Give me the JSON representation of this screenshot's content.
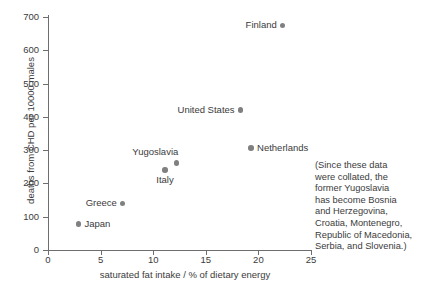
{
  "chart_data": {
    "type": "scatter",
    "title": "",
    "xlabel": "saturated fat intake / % of dietary energy",
    "ylabel": "deaths from CHD per 10000 males",
    "xlim": [
      0,
      25
    ],
    "ylim": [
      0,
      700
    ],
    "xticks": [
      0,
      5,
      10,
      15,
      20,
      25
    ],
    "yticks": [
      0,
      100,
      200,
      300,
      400,
      500,
      600,
      700
    ],
    "grid": false,
    "legend": "none",
    "point_color": "#808080",
    "axis_color": "#6e6e6e",
    "text_color": "#3b3b3b",
    "points": [
      {
        "label": "Japan",
        "x": 2.9,
        "y": 78,
        "label_position": "right"
      },
      {
        "label": "Greece",
        "x": 7.1,
        "y": 140,
        "label_position": "left"
      },
      {
        "label": "Italy",
        "x": 11.1,
        "y": 240,
        "label_position": "below"
      },
      {
        "label": "Yugoslavia",
        "x": 12.2,
        "y": 262,
        "label_position": "above-left"
      },
      {
        "label": "United States",
        "x": 18.3,
        "y": 420,
        "label_position": "left"
      },
      {
        "label": "Netherlands",
        "x": 19.3,
        "y": 307,
        "label_position": "right"
      },
      {
        "label": "Finland",
        "x": 22.3,
        "y": 675,
        "label_position": "left"
      }
    ]
  },
  "note": {
    "lines": [
      "(Since these data",
      "were collated, the",
      "former Yugoslavia",
      "has become Bosnia",
      "and Herzegovina,",
      "Croatia, Montenegro,",
      "Republic of Macedonia,",
      "Serbia, and Slovenia.)"
    ]
  }
}
